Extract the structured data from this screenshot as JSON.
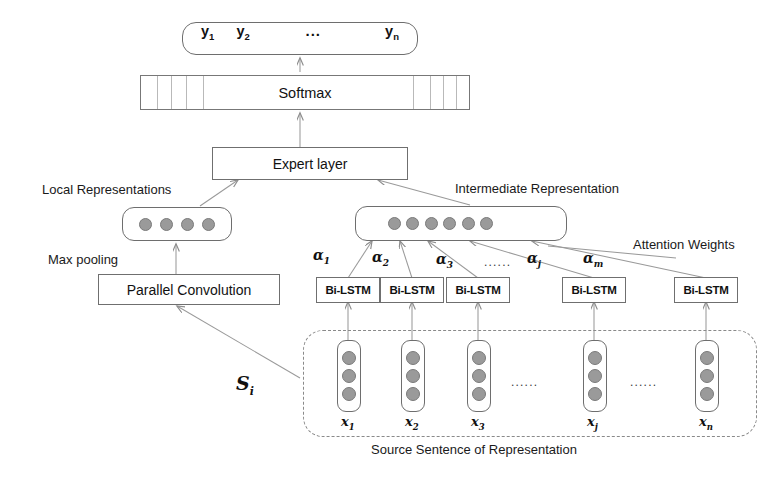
{
  "figure": {
    "caption": "Source Sentence of Representation"
  },
  "output_layer": {
    "items": [
      "y",
      "y",
      "y"
    ],
    "tokens": [
      {
        "base": "y",
        "sub": "1"
      },
      {
        "base": "y",
        "sub": "2"
      },
      {
        "base": "y",
        "sub": "n"
      }
    ],
    "ellipsis": "..."
  },
  "softmax": {
    "label": "Softmax"
  },
  "expert": {
    "label": "Expert  layer"
  },
  "local": {
    "title": "Local Representations",
    "pooling_label": "Max pooling",
    "conv_label": "Parallel  Convolution",
    "dot_count": 4
  },
  "intermediate": {
    "title": "Intermediate Representation",
    "dot_count": 6
  },
  "attention": {
    "title": "Attention Weights",
    "weights": [
      {
        "base": "α",
        "sub": "1"
      },
      {
        "base": "α",
        "sub": "2"
      },
      {
        "base": "α",
        "sub": "3"
      },
      {
        "base": "α",
        "sub": "j"
      },
      {
        "base": "α",
        "sub": "m"
      }
    ],
    "ellipsis": "......"
  },
  "encoder": {
    "cell_label": "Bi-LSTM",
    "cells": [
      "Bi-LSTM",
      "Bi-LSTM",
      "Bi-LSTM",
      "Bi-LSTM",
      "Bi-LSTM"
    ]
  },
  "sentence": {
    "sentence_symbol": {
      "base": "S",
      "sub": "i"
    },
    "words": [
      {
        "base": "x",
        "sub": "1"
      },
      {
        "base": "x",
        "sub": "2"
      },
      {
        "base": "x",
        "sub": "3"
      },
      {
        "base": "x",
        "sub": "j"
      },
      {
        "base": "x",
        "sub": "n"
      }
    ],
    "word_dot_count": 3,
    "ellipsis_mid": "......",
    "ellipsis_right": "......"
  },
  "colors": {
    "stroke": "#6e6e6e",
    "dot_fill": "#9a9a9a",
    "text": "#1a1a1a",
    "dashed": "#8a8a8a",
    "background": "#ffffff"
  }
}
